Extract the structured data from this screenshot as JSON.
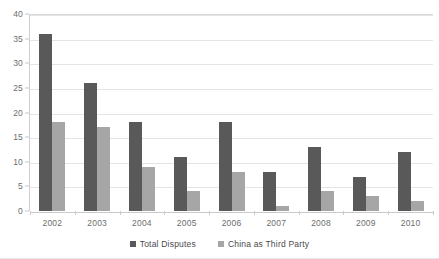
{
  "chart_data": {
    "type": "bar",
    "title": "",
    "subtitle": "",
    "xlabel": "",
    "ylabel": "",
    "categories": [
      "2002",
      "2003",
      "2004",
      "2005",
      "2006",
      "2007",
      "2008",
      "2009",
      "2010"
    ],
    "series": [
      {
        "name": "Total Disputes",
        "color": "#595959",
        "values": [
          36,
          26,
          18,
          11,
          18,
          8,
          13,
          7,
          12
        ]
      },
      {
        "name": "China as Third Party",
        "color": "#a6a6a6",
        "values": [
          18,
          17,
          9,
          4,
          8,
          1,
          4,
          3,
          2
        ]
      }
    ],
    "ylim": [
      0,
      40
    ],
    "ytick_step": 5,
    "yticks": [
      "0",
      "5",
      "10",
      "15",
      "20",
      "25",
      "30",
      "35",
      "40"
    ],
    "grid": "horizontal",
    "legend_position": "bottom-center",
    "axis_color": "#c9c9c9",
    "gridline_color": "#e4e4e4",
    "tick_label_color": "#6d6d6d"
  }
}
